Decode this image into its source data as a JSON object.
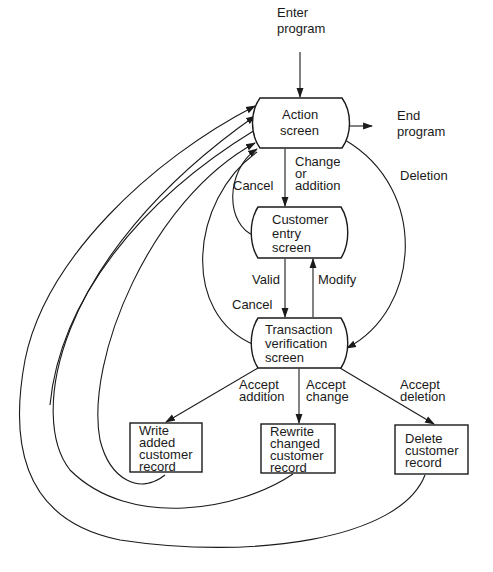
{
  "diagram": {
    "type": "flowchart",
    "title": "",
    "nodes": {
      "enter": {
        "lines": [
          "Enter",
          "program"
        ],
        "kind": "terminal-label"
      },
      "end": {
        "lines": [
          "End",
          "program"
        ],
        "kind": "terminal-label"
      },
      "action": {
        "lines": [
          "Action",
          "screen"
        ],
        "kind": "display"
      },
      "customer_entry": {
        "lines": [
          "Customer",
          "entry",
          "screen"
        ],
        "kind": "display"
      },
      "transaction": {
        "lines": [
          "Transaction",
          "verification",
          "screen"
        ],
        "kind": "display"
      },
      "write_added": {
        "lines": [
          "Write",
          "added",
          "customer",
          "record"
        ],
        "kind": "process"
      },
      "rewrite_changed": {
        "lines": [
          "Rewrite",
          "changed",
          "customer",
          "record"
        ],
        "kind": "process"
      },
      "delete_record": {
        "lines": [
          "Delete",
          "customer",
          "record"
        ],
        "kind": "process"
      }
    },
    "edge_labels": {
      "change_or_addition": [
        "Change",
        "or",
        "addition"
      ],
      "cancel_entry": [
        "Cancel"
      ],
      "deletion": [
        "Deletion"
      ],
      "valid": [
        "Valid"
      ],
      "modify": [
        "Modify"
      ],
      "cancel_transaction": [
        "Cancel"
      ],
      "accept_addition": [
        "Accept",
        "addition"
      ],
      "accept_change": [
        "Accept",
        "change"
      ],
      "accept_deletion": [
        "Accept",
        "deletion"
      ]
    },
    "edges": [
      {
        "from": "enter",
        "to": "action"
      },
      {
        "from": "action",
        "to": "end"
      },
      {
        "from": "action",
        "to": "customer_entry",
        "label": "Change or addition"
      },
      {
        "from": "customer_entry",
        "to": "action",
        "label": "Cancel"
      },
      {
        "from": "action",
        "to": "transaction",
        "label": "Deletion"
      },
      {
        "from": "customer_entry",
        "to": "transaction",
        "label": "Valid"
      },
      {
        "from": "transaction",
        "to": "customer_entry",
        "label": "Modify"
      },
      {
        "from": "transaction",
        "to": "action",
        "label": "Cancel"
      },
      {
        "from": "transaction",
        "to": "write_added",
        "label": "Accept addition"
      },
      {
        "from": "transaction",
        "to": "rewrite_changed",
        "label": "Accept change"
      },
      {
        "from": "transaction",
        "to": "delete_record",
        "label": "Accept deletion"
      },
      {
        "from": "write_added",
        "to": "action"
      },
      {
        "from": "rewrite_changed",
        "to": "action"
      },
      {
        "from": "delete_record",
        "to": "action"
      }
    ],
    "colors": {
      "ink": "#1a1a1a",
      "background": "#ffffff"
    }
  }
}
